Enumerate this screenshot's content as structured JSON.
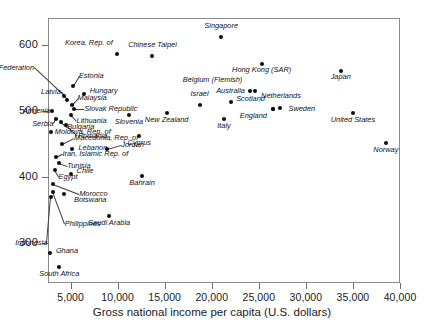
{
  "chart_data": {
    "type": "scatter",
    "title": "",
    "xlabel": "Gross national income per capita (U.S. dollars)",
    "ylabel": "",
    "xlim": [
      2600,
      40000
    ],
    "ylim": [
      240,
      640
    ],
    "xticks": [
      5000,
      10000,
      15000,
      20000,
      25000,
      30000,
      35000,
      40000
    ],
    "xticklabels": [
      "5,000",
      "10,000",
      "15,000",
      "20,000",
      "25,000",
      "30,000",
      "35,000",
      "40,000"
    ],
    "yticks": [
      300,
      400,
      500,
      600
    ],
    "yticklabels": [
      "300",
      "400",
      "500",
      "600"
    ],
    "grid": false,
    "legend": "none",
    "points": [
      {
        "label": "Korea, Rep. of",
        "x": 9900,
        "y": 585,
        "lx": -4,
        "ly": -11,
        "anchor": "r",
        "leader": false
      },
      {
        "label": "Chinese Taipei",
        "x": 13700,
        "y": 583,
        "lx": 0,
        "ly": -11,
        "anchor": "c",
        "leader": false
      },
      {
        "label": "Singapore",
        "x": 21000,
        "y": 612,
        "lx": 0,
        "ly": -11,
        "anchor": "c",
        "leader": false
      },
      {
        "label": "Hong Kong (SAR)",
        "x": 25300,
        "y": 570,
        "lx": 0,
        "ly": 6,
        "anchor": "c",
        "leader": false
      },
      {
        "label": "Japan",
        "x": 33700,
        "y": 560,
        "lx": 0,
        "ly": 6,
        "anchor": "c",
        "leader": false
      },
      {
        "label": "Estonia",
        "x": 5250,
        "y": 538,
        "lx": 6,
        "ly": -10,
        "anchor": "l",
        "leader": true
      },
      {
        "label": "Russian Federation",
        "x": 4300,
        "y": 522,
        "lx": -30,
        "ly": -28,
        "anchor": "r",
        "leader": true
      },
      {
        "label": "Hungary",
        "x": 6400,
        "y": 526,
        "lx": 6,
        "ly": -3,
        "anchor": "l",
        "leader": false
      },
      {
        "label": "Latvia",
        "x": 4600,
        "y": 516,
        "lx": -6,
        "ly": -8,
        "anchor": "r",
        "leader": true
      },
      {
        "label": "Malaysia",
        "x": 5100,
        "y": 508,
        "lx": 6,
        "ly": -7,
        "anchor": "l",
        "leader": true
      },
      {
        "label": "Slovak Republic",
        "x": 5400,
        "y": 502,
        "lx": 10,
        "ly": 0,
        "anchor": "l",
        "leader": true
      },
      {
        "label": "Lithuania",
        "x": 5000,
        "y": 494,
        "lx": 6,
        "ly": 6,
        "anchor": "l",
        "leader": true
      },
      {
        "label": "Armenia",
        "x": 3050,
        "y": 500,
        "lx": -2,
        "ly": 0,
        "anchor": "r",
        "leader": true
      },
      {
        "label": "Serbia",
        "x": 3400,
        "y": 488,
        "lx": -2,
        "ly": 5,
        "anchor": "r",
        "leader": true
      },
      {
        "label": "Bulgaria",
        "x": 4000,
        "y": 483,
        "lx": 6,
        "ly": 5,
        "anchor": "l",
        "leader": true
      },
      {
        "label": "Romania",
        "x": 4500,
        "y": 479,
        "lx": 12,
        "ly": 11,
        "anchor": "l",
        "leader": true
      },
      {
        "label": "Moldova, Rep. of",
        "x": 2900,
        "y": 468,
        "lx": 4,
        "ly": 0,
        "anchor": "l",
        "leader": false
      },
      {
        "label": "Macedonia, Rep. of",
        "x": 4100,
        "y": 450,
        "lx": 12,
        "ly": -6,
        "anchor": "l",
        "leader": true
      },
      {
        "label": "Lebanon",
        "x": 5200,
        "y": 442,
        "lx": 6,
        "ly": -1,
        "anchor": "l",
        "leader": false
      },
      {
        "label": "Jordan",
        "x": 8900,
        "y": 443,
        "lx": 14,
        "ly": -4,
        "anchor": "l",
        "leader": true
      },
      {
        "label": "Iran, Islamic Rep. of",
        "x": 3500,
        "y": 430,
        "lx": 6,
        "ly": -3,
        "anchor": "l",
        "leader": true
      },
      {
        "label": "Tunisia",
        "x": 3800,
        "y": 421,
        "lx": 8,
        "ly": 3,
        "anchor": "l",
        "leader": true
      },
      {
        "label": "Egypt",
        "x": 3300,
        "y": 411,
        "lx": 4,
        "ly": 7,
        "anchor": "l",
        "leader": true
      },
      {
        "label": "Chile",
        "x": 5000,
        "y": 404,
        "lx": 6,
        "ly": -3,
        "anchor": "l",
        "leader": false
      },
      {
        "label": "Morocco",
        "x": 3150,
        "y": 390,
        "lx": 26,
        "ly": 10,
        "anchor": "l",
        "leader": true
      },
      {
        "label": "Botswana",
        "x": 4300,
        "y": 375,
        "lx": 10,
        "ly": 6,
        "anchor": "l",
        "leader": false
      },
      {
        "label": "Philippines",
        "x": 3100,
        "y": 378,
        "lx": 12,
        "ly": 32,
        "anchor": "l",
        "leader": true
      },
      {
        "label": "Indonesia",
        "x": 2950,
        "y": 370,
        "lx": -4,
        "ly": 46,
        "anchor": "r",
        "leader": true
      },
      {
        "label": "Ghana",
        "x": 2800,
        "y": 285,
        "lx": 6,
        "ly": -2,
        "anchor": "l",
        "leader": false
      },
      {
        "label": "South Africa",
        "x": 3800,
        "y": 264,
        "lx": 0,
        "ly": 7,
        "anchor": "c",
        "leader": false
      },
      {
        "label": "Saudi Arabia",
        "x": 9100,
        "y": 341,
        "lx": 0,
        "ly": 7,
        "anchor": "c",
        "leader": false
      },
      {
        "label": "Bahrain",
        "x": 12600,
        "y": 401,
        "lx": 0,
        "ly": 7,
        "anchor": "c",
        "leader": false
      },
      {
        "label": "Cyprus",
        "x": 12300,
        "y": 462,
        "lx": 0,
        "ly": 7,
        "anchor": "c",
        "leader": false
      },
      {
        "label": "Slovenia",
        "x": 11200,
        "y": 493,
        "lx": 0,
        "ly": 7,
        "anchor": "c",
        "leader": false
      },
      {
        "label": "New Zealand",
        "x": 15200,
        "y": 496,
        "lx": 0,
        "ly": 7,
        "anchor": "c",
        "leader": false
      },
      {
        "label": "Israel",
        "x": 18700,
        "y": 509,
        "lx": 0,
        "ly": -11,
        "anchor": "c",
        "leader": false
      },
      {
        "label": "Australia",
        "x": 22000,
        "y": 513,
        "lx": 0,
        "ly": -11,
        "anchor": "c",
        "leader": false
      },
      {
        "label": "Italy",
        "x": 21300,
        "y": 488,
        "lx": 0,
        "ly": 7,
        "anchor": "c",
        "leader": false
      },
      {
        "label": "Belgium (Flemish)",
        "x": 24100,
        "y": 530,
        "lx": -8,
        "ly": -11,
        "anchor": "r",
        "leader": false
      },
      {
        "label": "Netherlands",
        "x": 24600,
        "y": 530,
        "lx": 6,
        "ly": 5,
        "anchor": "l",
        "leader": false
      },
      {
        "label": "Scotland",
        "x": 26500,
        "y": 503,
        "lx": -8,
        "ly": -10,
        "anchor": "r",
        "leader": false
      },
      {
        "label": "England",
        "x": 26500,
        "y": 503,
        "lx": -6,
        "ly": 7,
        "anchor": "r",
        "leader": false
      },
      {
        "label": "Sweden",
        "x": 27300,
        "y": 504,
        "lx": 8,
        "ly": 1,
        "anchor": "l",
        "leader": false
      },
      {
        "label": "United States",
        "x": 35000,
        "y": 497,
        "lx": 0,
        "ly": 7,
        "anchor": "c",
        "leader": false
      },
      {
        "label": "Norway",
        "x": 38500,
        "y": 452,
        "lx": 0,
        "ly": 7,
        "anchor": "c",
        "leader": false
      }
    ]
  }
}
